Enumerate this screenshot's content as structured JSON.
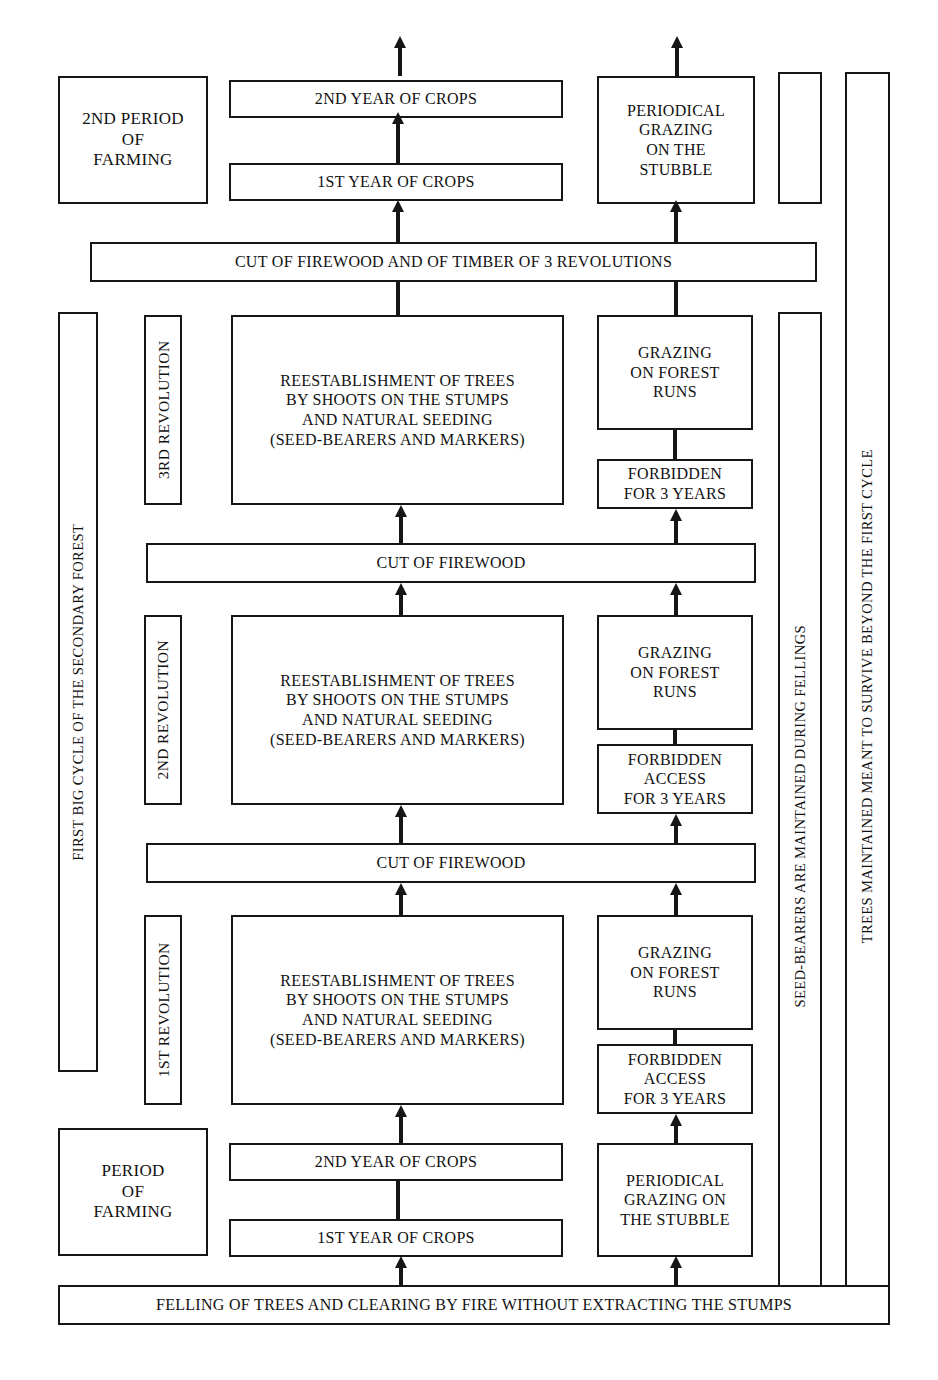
{
  "diagram": {
    "colors": {
      "ink": "#161616",
      "paper": "#ffffff"
    }
  },
  "left_labels": {
    "second_period_of_farming": "2ND PERIOD\nOF\nFARMING",
    "period_of_farming": "PERIOD\nOF\nFARMING",
    "first_big_cycle": "FIRST BIG CYCLE OF THE SECONDARY FOREST"
  },
  "revolutions": [
    {
      "label": "3RD REVOLUTION"
    },
    {
      "label": "2ND REVOLUTION"
    },
    {
      "label": "1ST REVOLUTION"
    }
  ],
  "right_labels": {
    "seed_bearers": "SEED-BEARERS ARE MAINTAINED DURING FELLINGS",
    "trees_maintained": "TREES MAINTAINED MEANT TO SURVIVE BEYOND THE FIRST CYCLE"
  },
  "center_boxes": {
    "crops_2nd_top": "2ND YEAR OF CROPS",
    "crops_1st_top": "1ST YEAR OF CROPS",
    "crops_2nd_bottom": "2ND YEAR OF CROPS",
    "crops_1st_bottom": "1ST YEAR OF CROPS",
    "reestablishment": "REESTABLISHMENT OF TREES\nBY SHOOTS ON THE STUMPS\nAND NATURAL SEEDING\n(SEED-BEARERS AND MARKERS)"
  },
  "banners": {
    "cut_firewood_timber": "CUT OF FIREWOOD AND OF TIMBER OF 3 REVOLUTIONS",
    "cut_firewood_upper": "CUT OF FIREWOOD",
    "cut_firewood_lower": "CUT OF FIREWOOD",
    "felling": "FELLING OF TREES AND CLEARING BY FIRE WITHOUT EXTRACTING THE STUMPS"
  },
  "right_boxes": {
    "periodical_grazing_top": "PERIODICAL\nGRAZING\nON THE\nSTUBBLE",
    "periodical_grazing_bottom": "PERIODICAL\nGRAZING ON\nTHE STUBBLE",
    "grazing_forest_runs": "GRAZING\nON FOREST\nRUNS",
    "forbidden_3rd": "FORBIDDEN\nFOR 3 YEARS",
    "forbidden_2nd": "FORBIDDEN\nACCESS\nFOR 3 YEARS",
    "forbidden_1st": "FORBIDDEN\nACCESS\nFOR 3 YEARS"
  }
}
